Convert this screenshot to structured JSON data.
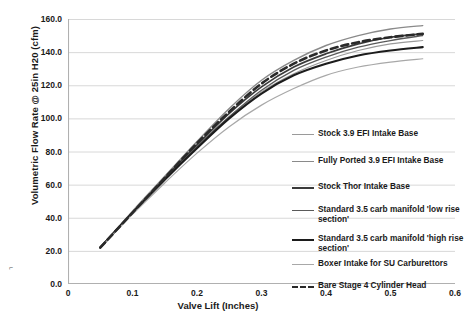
{
  "axes": {
    "ylabel": "Volumetric Flow Rate @ 25in H20 (cfm)",
    "xlabel": "Valve Lift (Inches)",
    "yticks": [
      "160.0",
      "140.0",
      "120.0",
      "100.0",
      "80.0",
      "60.0",
      "40.0",
      "20.0",
      "0.0"
    ],
    "xticks": [
      "0",
      "0.1",
      "0.2",
      "0.3",
      "0.4",
      "0.5",
      "0.6"
    ]
  },
  "legend": {
    "items": [
      {
        "label": "Stock 3.9 EFI Intake Base",
        "color": "#9a9a9a",
        "width": 1.1,
        "dash": "none"
      },
      {
        "label": "Fully Ported 3.9 EFI Intake Base",
        "color": "#8a8a8a",
        "width": 1.4,
        "dash": "none"
      },
      {
        "label": "Stock Thor Intake Base",
        "color": "#3a3a3a",
        "width": 1.7,
        "dash": "none"
      },
      {
        "label": "Standard 3.5 carb manifold 'low rise section'",
        "color": "#5a5a5a",
        "width": 1.3,
        "dash": "none"
      },
      {
        "label": "Standard 3.5 carb manifold 'high rise section'",
        "color": "#1c1c1c",
        "width": 2.1,
        "dash": "none"
      },
      {
        "label": "Boxer Intake for SU Carburettors",
        "color": "#a8a8a8",
        "width": 1.2,
        "dash": "none"
      },
      {
        "label": "Bare Stage 4 Cylinder Head",
        "color": "#2a2a2a",
        "width": 2.6,
        "dash": "7,4"
      }
    ]
  },
  "artifact": {
    "mark": "⌐"
  },
  "chart_data": {
    "type": "line",
    "title": "",
    "xlabel": "Valve Lift (Inches)",
    "ylabel": "Volumetric Flow Rate @ 25in H20 (cfm)",
    "xlim": [
      0,
      0.6
    ],
    "ylim": [
      0,
      160
    ],
    "xtick_step": 0.1,
    "ytick_step": 20,
    "grid": "horizontal",
    "legend_position": "right",
    "x": [
      0.05,
      0.1,
      0.15,
      0.2,
      0.25,
      0.3,
      0.35,
      0.4,
      0.45,
      0.5,
      0.55
    ],
    "series": [
      {
        "name": "Stock 3.9 EFI Intake Base",
        "color": "#9a9a9a",
        "values": [
          22,
          43,
          63,
          83,
          101,
          116,
          127,
          135,
          141,
          145,
          147
        ]
      },
      {
        "name": "Fully Ported 3.9 EFI Intake Base",
        "color": "#8a8a8a",
        "values": [
          22,
          44,
          65,
          86,
          106,
          123,
          135,
          144,
          150,
          154,
          156
        ]
      },
      {
        "name": "Stock Thor Intake Base",
        "color": "#3a3a3a",
        "values": [
          22,
          43,
          64,
          84,
          103,
          119,
          131,
          139,
          145,
          149,
          151
        ]
      },
      {
        "name": "Standard 3.5 carb manifold 'low rise section'",
        "color": "#5a5a5a",
        "values": [
          22,
          43,
          63,
          83,
          101,
          117,
          129,
          137,
          143,
          147,
          150
        ]
      },
      {
        "name": "Standard 3.5 carb manifold 'high rise section'",
        "color": "#1c1c1c",
        "values": [
          22,
          43,
          63,
          82,
          100,
          115,
          126,
          133,
          138,
          141,
          143
        ]
      },
      {
        "name": "Boxer Intake for SU Carburettors",
        "color": "#a8a8a8",
        "values": [
          22,
          42,
          61,
          79,
          95,
          108,
          118,
          126,
          131,
          134,
          136
        ]
      },
      {
        "name": "Bare Stage 4 Cylinder Head",
        "color": "#2a2a2a",
        "dash": "7,4",
        "values": [
          22,
          43,
          64,
          85,
          104,
          121,
          133,
          141,
          146,
          149,
          151
        ]
      }
    ]
  }
}
